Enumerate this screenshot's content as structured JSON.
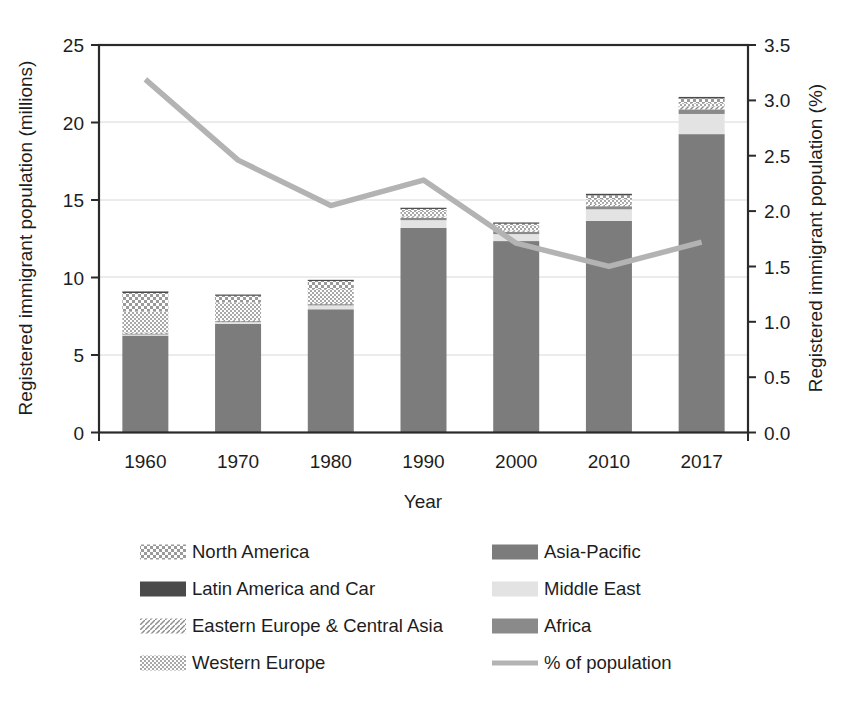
{
  "chart_data": {
    "type": "bar",
    "subtype": "stacked-bar-with-line",
    "title": "",
    "xlabel": "Year",
    "ylabel": "Registered immigrant population (millions)",
    "y2label": "Registered immigrant population (%)",
    "categories": [
      "1960",
      "1970",
      "1980",
      "1990",
      "2000",
      "2010",
      "2017"
    ],
    "ylim": [
      0,
      25
    ],
    "yticks": [
      "0",
      "5",
      "10",
      "15",
      "20",
      "25"
    ],
    "y2lim": [
      0.0,
      3.5
    ],
    "y2ticks": [
      "0.0",
      "0.5",
      "1.0",
      "1.5",
      "2.0",
      "2.5",
      "3.0",
      "3.5"
    ],
    "grid": true,
    "legend_position": "below",
    "series": [
      {
        "name": "Asia-Pacific",
        "key": "asia_pacific",
        "values": [
          6.25,
          7.0,
          7.95,
          13.2,
          12.35,
          13.65,
          19.25
        ]
      },
      {
        "name": "Middle East",
        "key": "middle_east",
        "values": [
          0.1,
          0.15,
          0.25,
          0.5,
          0.45,
          0.75,
          1.3
        ]
      },
      {
        "name": "Africa",
        "key": "africa",
        "values": [
          0.05,
          0.05,
          0.1,
          0.15,
          0.15,
          0.2,
          0.3
        ]
      },
      {
        "name": "Eastern Europe & Central Asia",
        "key": "eastern_europe",
        "values": [
          0.05,
          0.05,
          0.05,
          0.1,
          0.1,
          0.15,
          0.2
        ]
      },
      {
        "name": "Western Europe",
        "key": "western_europe",
        "values": [
          1.35,
          1.15,
          0.9,
          0.35,
          0.3,
          0.3,
          0.2
        ]
      },
      {
        "name": "North America",
        "key": "north_america",
        "values": [
          1.2,
          0.45,
          0.55,
          0.15,
          0.15,
          0.25,
          0.3
        ]
      },
      {
        "name": "Latin America and Car",
        "key": "latin_america",
        "values": [
          0.1,
          0.05,
          0.05,
          0.05,
          0.05,
          0.1,
          0.1
        ]
      }
    ],
    "totals": [
      9.1,
      8.9,
      9.85,
      14.5,
      13.55,
      15.4,
      21.65
    ],
    "line": {
      "name": "% of population",
      "values": [
        3.19,
        2.46,
        2.05,
        2.28,
        1.71,
        1.5,
        1.72
      ]
    }
  },
  "axes": {
    "left_title": "Registered immigrant population (millions)",
    "right_title": "Registered immigrant population (%)",
    "x_title": "Year"
  },
  "legend": {
    "left_column": [
      {
        "label": "North America",
        "swatch": "checker-light"
      },
      {
        "label": "Latin America and Car",
        "swatch": "solid-dark"
      },
      {
        "label": "Eastern Europe & Central Asia",
        "swatch": "diagonal"
      },
      {
        "label": "Western Europe",
        "swatch": "checker-fine"
      }
    ],
    "right_column": [
      {
        "label": "Asia-Pacific",
        "swatch": "solid-midgray"
      },
      {
        "label": "Middle East",
        "swatch": "solid-verylight"
      },
      {
        "label": "Africa",
        "swatch": "solid-gray"
      },
      {
        "label": "% of population",
        "swatch": "line-gray"
      }
    ]
  },
  "colors": {
    "asia_pacific": "#7c7c7c",
    "middle_east": "#e3e3e3",
    "africa": "#8a8a8a",
    "eastern_europe": "#bdbdbd",
    "western_europe": "#c9c9c9",
    "north_america": "#d0d0d0",
    "latin_america": "#4a4a4a",
    "line": "#b3b3b3",
    "axis": "#2a2a2a",
    "grid": "#d8d8d8",
    "text": "#1d1d1d"
  }
}
